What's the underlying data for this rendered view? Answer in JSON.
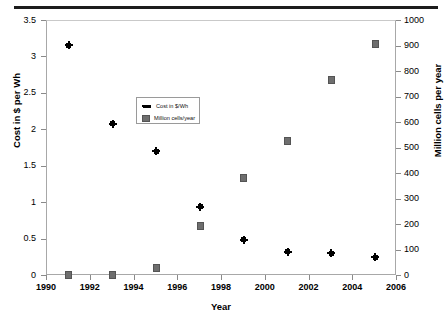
{
  "chart_data": {
    "type": "scatter",
    "title": "",
    "xlabel": "Year",
    "ylabel": "Cost in $ per Wh",
    "ylabel_right": "Million cells per year",
    "xlim": [
      1990,
      2006
    ],
    "ylim": [
      0,
      3.5
    ],
    "ylim_right": [
      0,
      1000
    ],
    "grid": false,
    "legend_position": "inside-upper-center",
    "x_ticks": [
      "1990",
      "1992",
      "1994",
      "1996",
      "1998",
      "2000",
      "2002",
      "2004",
      "2006"
    ],
    "y_ticks_left": [
      "0",
      "0.5",
      "1",
      "1.5",
      "2",
      "2.5",
      "3",
      "3.5"
    ],
    "y_ticks_right": [
      "0",
      "100",
      "200",
      "300",
      "400",
      "500",
      "600",
      "700",
      "800",
      "900",
      "1000"
    ],
    "x": [
      1991,
      1993,
      1995,
      1997,
      1999,
      2001,
      2003,
      2005
    ],
    "series": [
      {
        "name": "Cost in $/Wh",
        "axis": "left",
        "marker": "diamond",
        "color": "#000000",
        "values": [
          3.17,
          2.09,
          1.71,
          0.95,
          0.5,
          0.33,
          0.31,
          0.26
        ]
      },
      {
        "name": "Million cells/year",
        "axis": "right",
        "marker": "square",
        "color": "#6e6e6e",
        "values": [
          3,
          4,
          30,
          195,
          385,
          530,
          770,
          910
        ]
      }
    ]
  },
  "legend": {
    "items": [
      {
        "label": "Cost in $/Wh"
      },
      {
        "label": "Million cells/year"
      }
    ]
  }
}
